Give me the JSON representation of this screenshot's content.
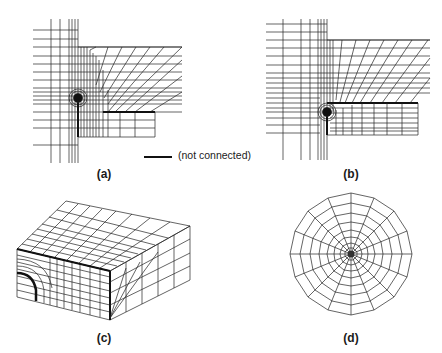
{
  "figure": {
    "panels": [
      {
        "id": "a",
        "label": "(a)",
        "description": "2D mesh, crack tip with focused mesh, crack face below tip (connected)"
      },
      {
        "id": "b",
        "label": "(b)",
        "description": "2D mesh, crack tip at corner of lower right block"
      },
      {
        "id": "c",
        "label": "(c)",
        "description": "3D block mesh with quarter-circle refined corner"
      },
      {
        "id": "d",
        "label": "(d)",
        "description": "Circular spider-web mesh focused at center"
      }
    ],
    "legend": {
      "symbol": "thick-line",
      "text": "(not connected)"
    }
  }
}
